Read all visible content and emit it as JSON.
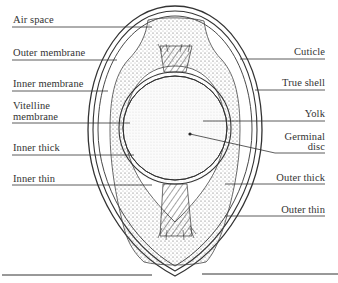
{
  "diagram": {
    "labels_left": [
      {
        "id": "air-space",
        "text": "Air space",
        "line2": ""
      },
      {
        "id": "outer-membrane",
        "text": "Outer membrane",
        "line2": ""
      },
      {
        "id": "inner-membrane",
        "text": "Inner membrane",
        "line2": ""
      },
      {
        "id": "vitelline-membrane",
        "text": "Vitelline",
        "line2": "membrane"
      },
      {
        "id": "inner-thick",
        "text": "Inner thick",
        "line2": ""
      },
      {
        "id": "inner-thin",
        "text": "Inner thin",
        "line2": ""
      }
    ],
    "labels_right": [
      {
        "id": "cuticle",
        "text": "Cuticle",
        "line2": ""
      },
      {
        "id": "true-shell",
        "text": "True shell",
        "line2": ""
      },
      {
        "id": "yolk",
        "text": "Yolk",
        "line2": ""
      },
      {
        "id": "germinal-disc",
        "text": "Germinal",
        "line2": "disc"
      },
      {
        "id": "outer-thick",
        "text": "Outer thick",
        "line2": ""
      },
      {
        "id": "outer-thin",
        "text": "Outer thin",
        "line2": ""
      }
    ],
    "colors": {
      "ink": "#333333",
      "background": "#ffffff",
      "stipple": "#555555"
    }
  }
}
